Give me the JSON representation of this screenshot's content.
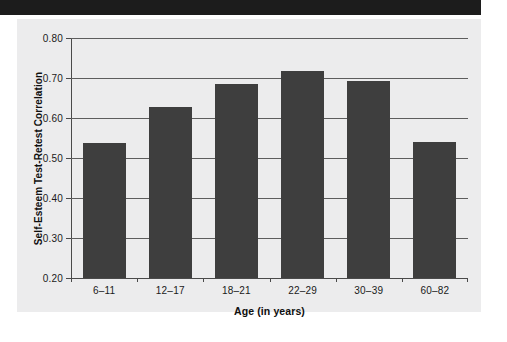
{
  "figure": {
    "banner_color": "#1c1c1c",
    "canvas_color": "#ececed",
    "bar_color": "#3e3e3e",
    "grid_color": "#5d5d5d",
    "axis_color": "#4a4a4a"
  },
  "chart_data": {
    "type": "bar",
    "title": "",
    "xlabel": "Age (in years)",
    "ylabel": "Self-Esteem Test-Retest Correlation",
    "categories": [
      "6–11",
      "12–17",
      "18–21",
      "22–29",
      "30–39",
      "60–82"
    ],
    "values": [
      0.537,
      0.628,
      0.685,
      0.717,
      0.693,
      0.54
    ],
    "ylim": [
      0.2,
      0.8
    ],
    "yticks": [
      0.2,
      0.3,
      0.4,
      0.5,
      0.6,
      0.7,
      0.8
    ],
    "ytick_labels": [
      "0.20",
      "0.30",
      "0.40",
      "0.50",
      "0.60",
      "0.70",
      "0.80"
    ],
    "grid": "horizontal",
    "legend": "none",
    "series": [
      {
        "name": "Self-Esteem Test-Retest Correlation",
        "values": [
          0.537,
          0.628,
          0.685,
          0.717,
          0.693,
          0.54
        ]
      }
    ]
  }
}
